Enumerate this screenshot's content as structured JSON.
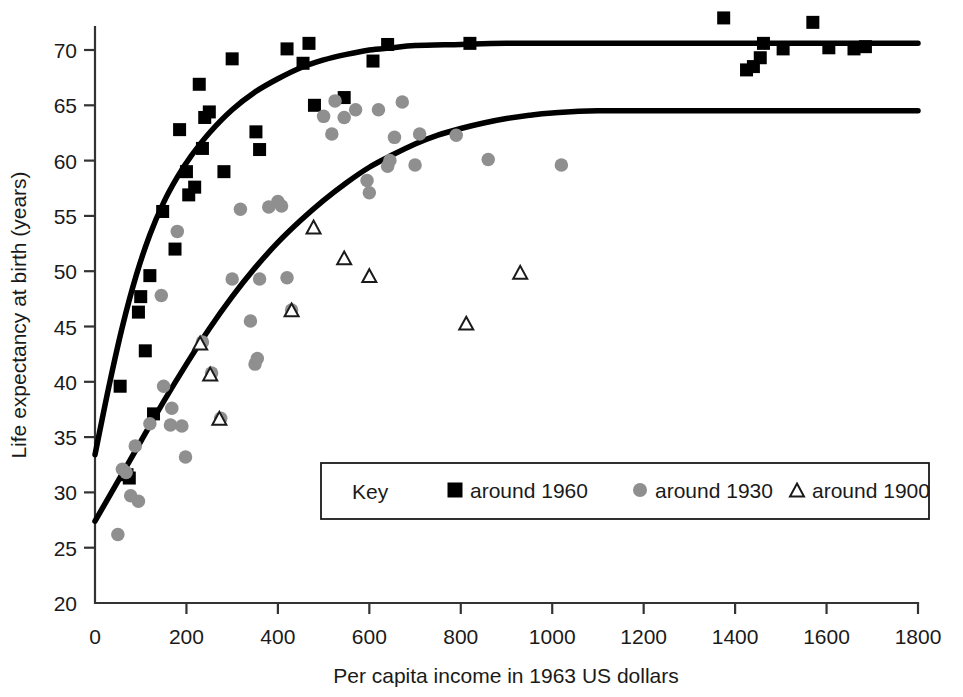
{
  "chart_data": {
    "type": "scatter",
    "title": "",
    "xlabel": "Per capita income in 1963 US dollars",
    "ylabel": "Life expectancy at birth (years)",
    "xlim": [
      0,
      1800
    ],
    "ylim": [
      20,
      73
    ],
    "xticks": [
      0,
      200,
      400,
      600,
      800,
      1000,
      1200,
      1400,
      1600,
      1800
    ],
    "yticks": [
      20,
      25,
      30,
      35,
      40,
      45,
      50,
      55,
      60,
      65,
      70
    ],
    "grid": false,
    "legend_position": "inside-lower-center",
    "legend_title": "Key",
    "series": [
      {
        "name": "around 1960",
        "marker": "square",
        "color": "#000000",
        "points": [
          [
            55,
            39.6
          ],
          [
            70,
            31.6
          ],
          [
            75,
            31.3
          ],
          [
            95,
            46.3
          ],
          [
            100,
            47.7
          ],
          [
            110,
            42.8
          ],
          [
            120,
            49.6
          ],
          [
            128,
            37.1
          ],
          [
            148,
            55.4
          ],
          [
            175,
            52.0
          ],
          [
            185,
            62.8
          ],
          [
            200,
            59.0
          ],
          [
            205,
            56.9
          ],
          [
            218,
            57.6
          ],
          [
            228,
            66.9
          ],
          [
            235,
            61.1
          ],
          [
            240,
            63.9
          ],
          [
            250,
            64.4
          ],
          [
            282,
            59.0
          ],
          [
            300,
            69.2
          ],
          [
            352,
            62.6
          ],
          [
            360,
            61.0
          ],
          [
            420,
            70.1
          ],
          [
            455,
            68.8
          ],
          [
            468,
            70.6
          ],
          [
            480,
            65.0
          ],
          [
            545,
            65.7
          ],
          [
            608,
            69.0
          ],
          [
            640,
            70.5
          ],
          [
            820,
            70.6
          ],
          [
            1375,
            72.9
          ],
          [
            1425,
            68.2
          ],
          [
            1440,
            68.5
          ],
          [
            1455,
            69.3
          ],
          [
            1462,
            70.6
          ],
          [
            1505,
            70.1
          ],
          [
            1570,
            72.5
          ],
          [
            1605,
            70.2
          ],
          [
            1660,
            70.1
          ],
          [
            1685,
            70.3
          ]
        ]
      },
      {
        "name": "around 1930",
        "marker": "circle",
        "color": "#8f8f8f",
        "points": [
          [
            50,
            26.2
          ],
          [
            60,
            32.1
          ],
          [
            68,
            31.8
          ],
          [
            78,
            29.7
          ],
          [
            88,
            34.2
          ],
          [
            95,
            29.2
          ],
          [
            120,
            36.2
          ],
          [
            145,
            47.8
          ],
          [
            150,
            39.6
          ],
          [
            165,
            36.1
          ],
          [
            168,
            37.6
          ],
          [
            180,
            53.6
          ],
          [
            190,
            36.0
          ],
          [
            198,
            33.2
          ],
          [
            235,
            43.6
          ],
          [
            255,
            40.8
          ],
          [
            275,
            36.7
          ],
          [
            300,
            49.3
          ],
          [
            318,
            55.6
          ],
          [
            340,
            45.5
          ],
          [
            350,
            41.6
          ],
          [
            355,
            42.1
          ],
          [
            360,
            49.3
          ],
          [
            380,
            55.8
          ],
          [
            400,
            56.3
          ],
          [
            408,
            55.9
          ],
          [
            420,
            49.4
          ],
          [
            430,
            46.5
          ],
          [
            500,
            64.0
          ],
          [
            518,
            62.4
          ],
          [
            525,
            65.4
          ],
          [
            545,
            63.9
          ],
          [
            570,
            64.6
          ],
          [
            595,
            58.2
          ],
          [
            600,
            57.1
          ],
          [
            620,
            64.6
          ],
          [
            640,
            59.5
          ],
          [
            645,
            60.0
          ],
          [
            655,
            62.1
          ],
          [
            672,
            65.3
          ],
          [
            700,
            59.6
          ],
          [
            710,
            62.4
          ],
          [
            790,
            62.3
          ],
          [
            860,
            60.1
          ],
          [
            1020,
            59.6
          ]
        ]
      },
      {
        "name": "around 1900",
        "marker": "triangle",
        "color": "#ffffff",
        "edge": "#1a1a1a",
        "points": [
          [
            230,
            43.5
          ],
          [
            252,
            40.7
          ],
          [
            272,
            36.7
          ],
          [
            430,
            46.5
          ],
          [
            478,
            54.0
          ],
          [
            545,
            51.2
          ],
          [
            600,
            49.6
          ],
          [
            812,
            45.3
          ],
          [
            930,
            49.9
          ]
        ]
      }
    ],
    "fit_curves": [
      {
        "name": "around 1960 fit",
        "points": [
          [
            0,
            33.4
          ],
          [
            30,
            39.5
          ],
          [
            60,
            45.0
          ],
          [
            90,
            49.6
          ],
          [
            120,
            53.3
          ],
          [
            150,
            56.2
          ],
          [
            180,
            58.5
          ],
          [
            210,
            60.4
          ],
          [
            250,
            62.5
          ],
          [
            300,
            64.6
          ],
          [
            350,
            66.2
          ],
          [
            400,
            67.4
          ],
          [
            450,
            68.4
          ],
          [
            500,
            69.1
          ],
          [
            550,
            69.6
          ],
          [
            600,
            70.0
          ],
          [
            650,
            70.2
          ],
          [
            700,
            70.4
          ],
          [
            800,
            70.5
          ],
          [
            900,
            70.6
          ],
          [
            1100,
            70.6
          ],
          [
            1400,
            70.6
          ],
          [
            1800,
            70.6
          ]
        ]
      },
      {
        "name": "around 1930 fit",
        "points": [
          [
            0,
            27.4
          ],
          [
            50,
            31.0
          ],
          [
            100,
            34.6
          ],
          [
            150,
            38.2
          ],
          [
            200,
            41.6
          ],
          [
            250,
            44.8
          ],
          [
            300,
            47.7
          ],
          [
            350,
            50.3
          ],
          [
            400,
            52.6
          ],
          [
            450,
            54.6
          ],
          [
            500,
            56.4
          ],
          [
            550,
            58.0
          ],
          [
            600,
            59.4
          ],
          [
            650,
            60.5
          ],
          [
            700,
            61.5
          ],
          [
            750,
            62.3
          ],
          [
            800,
            62.9
          ],
          [
            850,
            63.4
          ],
          [
            900,
            63.8
          ],
          [
            950,
            64.1
          ],
          [
            1000,
            64.3
          ],
          [
            1100,
            64.5
          ],
          [
            1300,
            64.5
          ],
          [
            1800,
            64.5
          ]
        ]
      }
    ]
  },
  "legend": {
    "title": "Key",
    "entries": [
      {
        "label": "around 1960",
        "marker": "square",
        "color": "#000000"
      },
      {
        "label": "around 1930",
        "marker": "circle",
        "color": "#8f8f8f"
      },
      {
        "label": "around 1900",
        "marker": "triangle",
        "color": "#ffffff"
      }
    ]
  },
  "axes": {
    "x_title": "Per capita income in 1963 US dollars",
    "y_title": "Life expectancy at birth (years)",
    "x_tick_labels": [
      "0",
      "200",
      "400",
      "600",
      "800",
      "1000",
      "1200",
      "1400",
      "1600",
      "1800"
    ],
    "y_tick_labels": [
      "20",
      "25",
      "30",
      "35",
      "40",
      "45",
      "50",
      "55",
      "60",
      "65",
      "70"
    ]
  },
  "colors": {
    "series_1960": "#000000",
    "series_1930": "#8f8f8f",
    "series_1900_edge": "#1a1a1a",
    "axis": "#333333",
    "background": "#ffffff"
  }
}
